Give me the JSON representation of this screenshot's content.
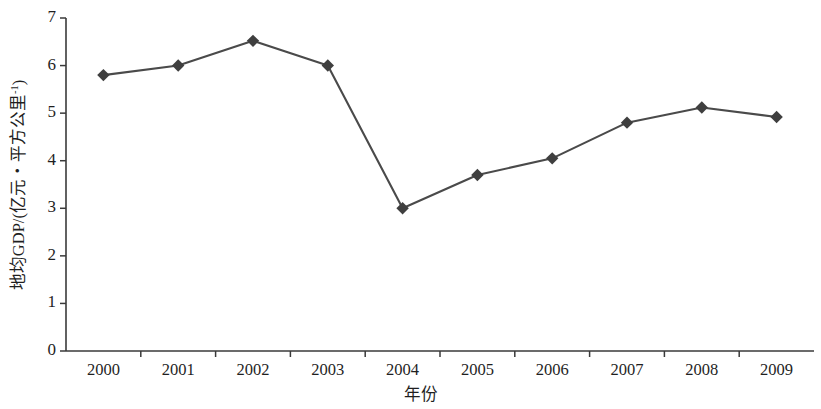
{
  "chart_data": {
    "type": "line",
    "title": "",
    "subtitle": "",
    "xlabel": "年份",
    "ylabel": "地均GDP/(亿元·平方公里⁻¹)",
    "ylabel_base": "地均GDP/(亿元・平方公里",
    "ylabel_sup": "-1",
    "ylabel_tail": ")",
    "categories": [
      "2000",
      "2001",
      "2002",
      "2003",
      "2004",
      "2005",
      "2006",
      "2007",
      "2008",
      "2009"
    ],
    "values": [
      5.8,
      6.0,
      6.52,
      6.0,
      3.0,
      3.7,
      4.05,
      4.8,
      5.12,
      4.92
    ],
    "series": [
      {
        "name": "地均GDP",
        "values": [
          5.8,
          6.0,
          6.52,
          6.0,
          3.0,
          3.7,
          4.05,
          4.8,
          5.12,
          4.92
        ]
      }
    ],
    "ylim": [
      0,
      7
    ],
    "yticks": [
      0,
      1,
      2,
      3,
      4,
      5,
      6,
      7
    ],
    "ytick_labels": [
      "0",
      "1",
      "2",
      "3",
      "4",
      "5",
      "6",
      "7"
    ],
    "xtick_labels": [
      "2000",
      "2001",
      "2002",
      "2003",
      "2004",
      "2005",
      "2006",
      "2007",
      "2008",
      "2009"
    ],
    "grid": false,
    "legend": false,
    "legend_position": "none",
    "marker": "diamond",
    "line_color": "#4a4a4a",
    "marker_color": "#3f3f3f",
    "axis_color": "#3a3a3a",
    "background_color": "#ffffff"
  },
  "axes": {
    "y_title": "地均GDP/(亿元・平方公里",
    "y_title_sup": "-1",
    "y_title_tail": ")",
    "x_title": "年份"
  }
}
